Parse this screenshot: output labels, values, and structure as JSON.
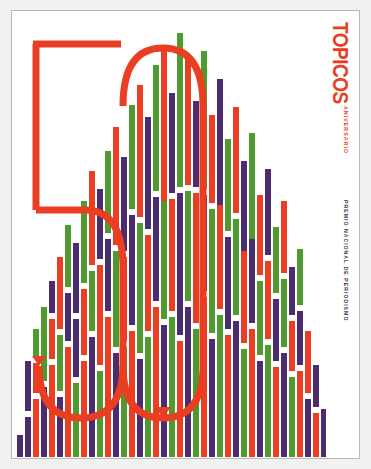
{
  "poster": {
    "masthead": "TOPICOS",
    "anniversary_label": "ANIVERSARIO",
    "award_label": "PREMIO NACIONAL DE PERIODISMO",
    "anniversary_number": "50"
  },
  "colors": {
    "red": "#ea3d22",
    "green": "#4f9a2e",
    "purple": "#4b2c6e",
    "white": "#ffffff",
    "page": "#ffffff",
    "frame": "#b9b9b7",
    "backdrop": "#f2f1ef"
  },
  "chart_data": {
    "type": "bar",
    "title": "",
    "xlabel": "",
    "ylabel": "",
    "grid": false,
    "legend": "none",
    "note": "Decorative triangular (pyramid) composition of stacked vertical bars in red, green and purple separated by white gaps; bar heights rise toward the centre.",
    "ylim": [
      0,
      443
    ],
    "series": [
      {
        "name": "red",
        "color": "#ea3d22"
      },
      {
        "name": "green",
        "color": "#4f9a2e"
      },
      {
        "name": "purple",
        "color": "#4b2c6e"
      }
    ],
    "columns": [
      {
        "x": 2,
        "w": 6,
        "h": 22,
        "segments": [
          {
            "c": "purple",
            "b": 0,
            "h": 22
          }
        ]
      },
      {
        "x": 10,
        "w": 6,
        "h": 96,
        "segments": [
          {
            "c": "purple",
            "b": 0,
            "h": 40
          },
          {
            "c": "purple",
            "b": 46,
            "h": 50
          }
        ]
      },
      {
        "x": 18,
        "w": 6,
        "h": 128,
        "segments": [
          {
            "c": "red",
            "b": 0,
            "h": 58
          },
          {
            "c": "red",
            "b": 64,
            "h": 30
          },
          {
            "c": "green",
            "b": 100,
            "h": 28
          }
        ]
      },
      {
        "x": 26,
        "w": 6,
        "h": 150,
        "segments": [
          {
            "c": "purple",
            "b": 0,
            "h": 70
          },
          {
            "c": "green",
            "b": 76,
            "h": 74
          }
        ]
      },
      {
        "x": 34,
        "w": 6,
        "h": 176,
        "segments": [
          {
            "c": "red",
            "b": 0,
            "h": 92
          },
          {
            "c": "red",
            "b": 98,
            "h": 40
          },
          {
            "c": "purple",
            "b": 144,
            "h": 32
          }
        ]
      },
      {
        "x": 42,
        "w": 6,
        "h": 200,
        "segments": [
          {
            "c": "purple",
            "b": 0,
            "h": 60
          },
          {
            "c": "green",
            "b": 66,
            "h": 56
          },
          {
            "c": "red",
            "b": 128,
            "h": 72
          }
        ]
      },
      {
        "x": 50,
        "w": 6,
        "h": 232,
        "segments": [
          {
            "c": "red",
            "b": 0,
            "h": 110
          },
          {
            "c": "purple",
            "b": 116,
            "h": 48
          },
          {
            "c": "green",
            "b": 170,
            "h": 62
          }
        ]
      },
      {
        "x": 58,
        "w": 6,
        "h": 214,
        "segments": [
          {
            "c": "green",
            "b": 0,
            "h": 74
          },
          {
            "c": "purple",
            "b": 80,
            "h": 58
          },
          {
            "c": "purple",
            "b": 144,
            "h": 70
          }
        ]
      },
      {
        "x": 66,
        "w": 6,
        "h": 256,
        "segments": [
          {
            "c": "red",
            "b": 0,
            "h": 96
          },
          {
            "c": "red",
            "b": 102,
            "h": 66
          },
          {
            "c": "green",
            "b": 174,
            "h": 82
          }
        ]
      },
      {
        "x": 74,
        "w": 6,
        "h": 286,
        "segments": [
          {
            "c": "purple",
            "b": 0,
            "h": 120
          },
          {
            "c": "green",
            "b": 126,
            "h": 60
          },
          {
            "c": "red",
            "b": 192,
            "h": 94
          }
        ]
      },
      {
        "x": 82,
        "w": 6,
        "h": 268,
        "segments": [
          {
            "c": "green",
            "b": 0,
            "h": 86
          },
          {
            "c": "red",
            "b": 92,
            "h": 100
          },
          {
            "c": "purple",
            "b": 198,
            "h": 70
          }
        ]
      },
      {
        "x": 90,
        "w": 6,
        "h": 306,
        "segments": [
          {
            "c": "red",
            "b": 0,
            "h": 140
          },
          {
            "c": "purple",
            "b": 146,
            "h": 72
          },
          {
            "c": "green",
            "b": 224,
            "h": 82
          }
        ]
      },
      {
        "x": 98,
        "w": 6,
        "h": 330,
        "segments": [
          {
            "c": "purple",
            "b": 0,
            "h": 104
          },
          {
            "c": "green",
            "b": 110,
            "h": 96
          },
          {
            "c": "red",
            "b": 212,
            "h": 118
          }
        ]
      },
      {
        "x": 106,
        "w": 6,
        "h": 300,
        "segments": [
          {
            "c": "green",
            "b": 0,
            "h": 110
          },
          {
            "c": "red",
            "b": 116,
            "h": 84
          },
          {
            "c": "purple",
            "b": 206,
            "h": 94
          }
        ]
      },
      {
        "x": 114,
        "w": 6,
        "h": 352,
        "segments": [
          {
            "c": "red",
            "b": 0,
            "h": 126
          },
          {
            "c": "purple",
            "b": 132,
            "h": 110
          },
          {
            "c": "green",
            "b": 248,
            "h": 104
          }
        ]
      },
      {
        "x": 122,
        "w": 6,
        "h": 372,
        "segments": [
          {
            "c": "purple",
            "b": 0,
            "h": 98
          },
          {
            "c": "green",
            "b": 104,
            "h": 130
          },
          {
            "c": "red",
            "b": 240,
            "h": 132
          }
        ]
      },
      {
        "x": 130,
        "w": 6,
        "h": 340,
        "segments": [
          {
            "c": "green",
            "b": 0,
            "h": 120
          },
          {
            "c": "red",
            "b": 126,
            "h": 96
          },
          {
            "c": "purple",
            "b": 228,
            "h": 112
          }
        ]
      },
      {
        "x": 138,
        "w": 6,
        "h": 392,
        "segments": [
          {
            "c": "red",
            "b": 0,
            "h": 150
          },
          {
            "c": "purple",
            "b": 156,
            "h": 104
          },
          {
            "c": "green",
            "b": 266,
            "h": 126
          }
        ]
      },
      {
        "x": 146,
        "w": 6,
        "h": 410,
        "segments": [
          {
            "c": "purple",
            "b": 0,
            "h": 132
          },
          {
            "c": "green",
            "b": 138,
            "h": 118
          },
          {
            "c": "red",
            "b": 256,
            "h": 154
          }
        ]
      },
      {
        "x": 154,
        "w": 6,
        "h": 364,
        "segments": [
          {
            "c": "green",
            "b": 0,
            "h": 140
          },
          {
            "c": "red",
            "b": 146,
            "h": 112
          },
          {
            "c": "purple",
            "b": 264,
            "h": 100
          }
        ]
      },
      {
        "x": 162,
        "w": 6,
        "h": 424,
        "segments": [
          {
            "c": "red",
            "b": 0,
            "h": 116
          },
          {
            "c": "purple",
            "b": 122,
            "h": 142
          },
          {
            "c": "green",
            "b": 270,
            "h": 154
          }
        ]
      },
      {
        "x": 170,
        "w": 6,
        "h": 398,
        "segments": [
          {
            "c": "purple",
            "b": 0,
            "h": 150
          },
          {
            "c": "green",
            "b": 156,
            "h": 110
          },
          {
            "c": "red",
            "b": 272,
            "h": 126
          }
        ]
      },
      {
        "x": 178,
        "w": 6,
        "h": 356,
        "segments": [
          {
            "c": "green",
            "b": 0,
            "h": 128
          },
          {
            "c": "red",
            "b": 134,
            "h": 130
          },
          {
            "c": "purple",
            "b": 270,
            "h": 86
          }
        ]
      },
      {
        "x": 186,
        "w": 6,
        "h": 406,
        "segments": [
          {
            "c": "red",
            "b": 0,
            "h": 160
          },
          {
            "c": "purple",
            "b": 166,
            "h": 96
          },
          {
            "c": "green",
            "b": 268,
            "h": 138
          }
        ]
      },
      {
        "x": 194,
        "w": 6,
        "h": 342,
        "segments": [
          {
            "c": "purple",
            "b": 0,
            "h": 118
          },
          {
            "c": "green",
            "b": 124,
            "h": 124
          },
          {
            "c": "red",
            "b": 254,
            "h": 88
          }
        ]
      },
      {
        "x": 202,
        "w": 6,
        "h": 378,
        "segments": [
          {
            "c": "green",
            "b": 0,
            "h": 142
          },
          {
            "c": "red",
            "b": 148,
            "h": 104
          },
          {
            "c": "purple",
            "b": 252,
            "h": 126
          }
        ]
      },
      {
        "x": 210,
        "w": 6,
        "h": 318,
        "segments": [
          {
            "c": "red",
            "b": 0,
            "h": 122
          },
          {
            "c": "purple",
            "b": 128,
            "h": 92
          },
          {
            "c": "green",
            "b": 226,
            "h": 92
          }
        ]
      },
      {
        "x": 218,
        "w": 6,
        "h": 350,
        "segments": [
          {
            "c": "purple",
            "b": 0,
            "h": 136
          },
          {
            "c": "green",
            "b": 142,
            "h": 96
          },
          {
            "c": "red",
            "b": 244,
            "h": 106
          }
        ]
      },
      {
        "x": 226,
        "w": 6,
        "h": 296,
        "segments": [
          {
            "c": "green",
            "b": 0,
            "h": 108
          },
          {
            "c": "red",
            "b": 114,
            "h": 92
          },
          {
            "c": "purple",
            "b": 206,
            "h": 90
          }
        ]
      },
      {
        "x": 234,
        "w": 6,
        "h": 324,
        "segments": [
          {
            "c": "red",
            "b": 0,
            "h": 128
          },
          {
            "c": "purple",
            "b": 134,
            "h": 84
          },
          {
            "c": "green",
            "b": 218,
            "h": 106
          }
        ]
      },
      {
        "x": 242,
        "w": 6,
        "h": 262,
        "segments": [
          {
            "c": "purple",
            "b": 0,
            "h": 96
          },
          {
            "c": "green",
            "b": 102,
            "h": 74
          },
          {
            "c": "red",
            "b": 182,
            "h": 80
          }
        ]
      },
      {
        "x": 250,
        "w": 6,
        "h": 288,
        "segments": [
          {
            "c": "green",
            "b": 0,
            "h": 112
          },
          {
            "c": "red",
            "b": 118,
            "h": 78
          },
          {
            "c": "purple",
            "b": 202,
            "h": 86
          }
        ]
      },
      {
        "x": 258,
        "w": 6,
        "h": 230,
        "segments": [
          {
            "c": "red",
            "b": 0,
            "h": 90
          },
          {
            "c": "purple",
            "b": 96,
            "h": 62
          },
          {
            "c": "green",
            "b": 164,
            "h": 66
          }
        ]
      },
      {
        "x": 266,
        "w": 6,
        "h": 256,
        "segments": [
          {
            "c": "purple",
            "b": 0,
            "h": 104
          },
          {
            "c": "green",
            "b": 110,
            "h": 68
          },
          {
            "c": "red",
            "b": 184,
            "h": 72
          }
        ]
      },
      {
        "x": 274,
        "w": 6,
        "h": 190,
        "segments": [
          {
            "c": "green",
            "b": 0,
            "h": 80
          },
          {
            "c": "red",
            "b": 86,
            "h": 50
          },
          {
            "c": "purple",
            "b": 142,
            "h": 48
          }
        ]
      },
      {
        "x": 282,
        "w": 6,
        "h": 208,
        "segments": [
          {
            "c": "red",
            "b": 0,
            "h": 86
          },
          {
            "c": "purple",
            "b": 92,
            "h": 54
          },
          {
            "c": "green",
            "b": 152,
            "h": 56
          }
        ]
      },
      {
        "x": 290,
        "w": 6,
        "h": 126,
        "segments": [
          {
            "c": "purple",
            "b": 0,
            "h": 58
          },
          {
            "c": "red",
            "b": 64,
            "h": 62
          }
        ]
      },
      {
        "x": 298,
        "w": 6,
        "h": 92,
        "segments": [
          {
            "c": "red",
            "b": 0,
            "h": 44
          },
          {
            "c": "purple",
            "b": 50,
            "h": 42
          }
        ]
      },
      {
        "x": 306,
        "w": 5,
        "h": 48,
        "segments": [
          {
            "c": "purple",
            "b": 0,
            "h": 48
          }
        ]
      }
    ]
  }
}
